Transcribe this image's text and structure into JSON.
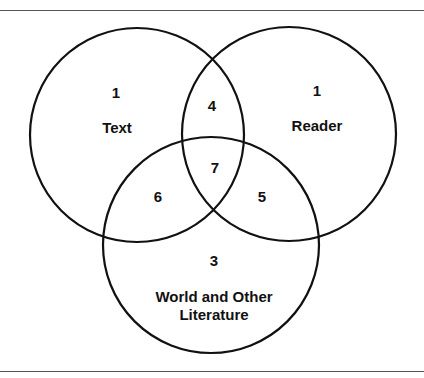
{
  "diagram": {
    "type": "venn",
    "sets": [
      {
        "name": "Text",
        "unique_value": "1"
      },
      {
        "name": "Reader",
        "unique_value": "1"
      },
      {
        "name": "World and Other Literature",
        "label_line1": "World and Other",
        "label_line2": "Literature",
        "unique_value": "3"
      }
    ],
    "intersections": {
      "text_reader": "4",
      "text_world": "6",
      "reader_world": "5",
      "all_three": "7"
    }
  }
}
